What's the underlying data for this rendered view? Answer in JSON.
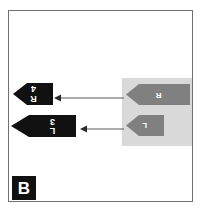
{
  "figure": {
    "panel_label": "B",
    "background_color": "#ffffff",
    "frame_color": "#707070"
  },
  "diagram_data": {
    "type": "gene-arrow-map",
    "highlight_block": {
      "color": "#d9d9d9",
      "name": "grey-highlight-region"
    },
    "elements": [
      {
        "id": "arrow-r4",
        "label": "R4",
        "label_chars": [
          "R",
          "4"
        ],
        "fill": "#111111",
        "direction": "left",
        "row": 1,
        "group": "black"
      },
      {
        "id": "arrow-3l",
        "label": "3L",
        "label_chars": [
          "3",
          "L"
        ],
        "fill": "#111111",
        "direction": "left",
        "row": 2,
        "group": "black"
      },
      {
        "id": "arrow-gr",
        "label": "R",
        "label_chars": [
          "R"
        ],
        "fill": "#808080",
        "direction": "left",
        "row": 1,
        "group": "grey"
      },
      {
        "id": "arrow-gl",
        "label": "L",
        "label_chars": [
          "L"
        ],
        "fill": "#808080",
        "direction": "left",
        "row": 2,
        "group": "grey"
      }
    ],
    "connectors": [
      {
        "id": "connector-top",
        "from": "arrow-gr",
        "to": "arrow-r4",
        "direction": "left",
        "color": "#5a5a5a"
      },
      {
        "id": "connector-bottom",
        "from": "arrow-gl",
        "to": "arrow-3l",
        "direction": "left",
        "color": "#5a5a5a"
      }
    ]
  }
}
